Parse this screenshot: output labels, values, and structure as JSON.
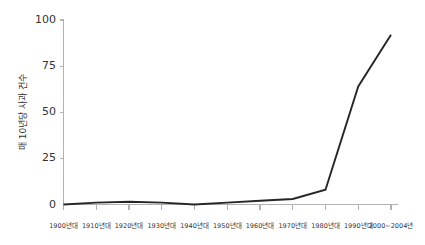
{
  "chart_data": {
    "type": "line",
    "title": "",
    "xlabel": "",
    "ylabel": "매 10년당 사과 건수",
    "categories": [
      "1900년대",
      "1910년대",
      "1920년대",
      "1930년대",
      "1940년대",
      "1950년대",
      "1960년대",
      "1970년대",
      "1980년대",
      "1990년대",
      "2000~2004년"
    ],
    "values": [
      0,
      1,
      1.5,
      1,
      0,
      1,
      2,
      3,
      8,
      64,
      92
    ],
    "ylim": [
      0,
      100
    ],
    "yticks": [
      0,
      25,
      50,
      75,
      100
    ],
    "ytick_labels": [
      "0",
      "25",
      "50",
      "75",
      "100"
    ],
    "grid": false,
    "legend": false,
    "series": [
      {
        "name": "매 10년당 사과 건수",
        "values": [
          0,
          1,
          1.5,
          1,
          0,
          1,
          2,
          3,
          8,
          64,
          92
        ]
      }
    ],
    "colors": {
      "line": "#262626",
      "axis": "#b2b2b2",
      "text": "#333333",
      "background": "#ffffff"
    }
  }
}
